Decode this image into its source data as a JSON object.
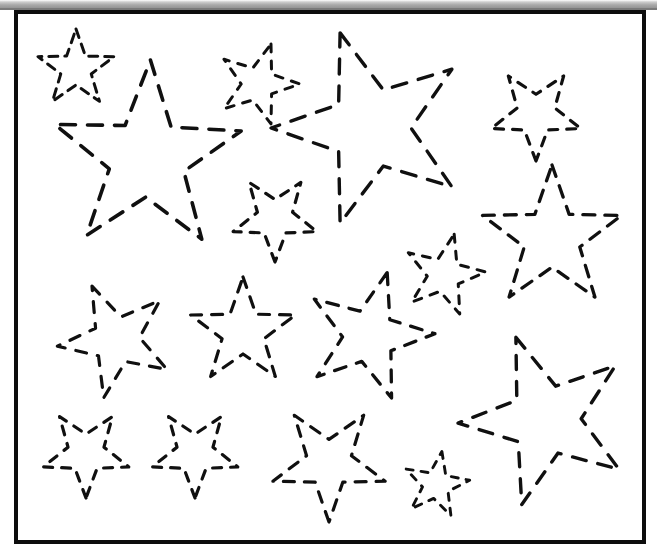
{
  "page": {
    "width": 657,
    "height": 548,
    "background_color": "#ffffff",
    "kind": "tracing-worksheet"
  },
  "scan_artifact": {
    "name": "top-gray-strip",
    "color": "#9a9a9a",
    "height_px": 9
  },
  "frame": {
    "border_color": "#0d0d0d",
    "border_width_px": 4,
    "x": 14,
    "y": 10,
    "width": 632,
    "height": 534
  },
  "stroke": {
    "color": "#101010",
    "dash_style": "dashed",
    "linecap": "round"
  },
  "chart_data": {
    "type": "scatter",
    "title": "",
    "xlabel": "",
    "ylabel": "",
    "count": 18,
    "stars": [
      {
        "id": "star-1",
        "cx": 76,
        "cy": 69,
        "outer_r": 40,
        "inner_ratio": 0.4,
        "rotation_deg": 0,
        "stroke_width": 3.0,
        "dash": "9 7",
        "size": "small"
      },
      {
        "id": "star-2",
        "cx": 147,
        "cy": 158,
        "outer_r": 98,
        "inner_ratio": 0.4,
        "rotation_deg": 2,
        "stroke_width": 3.6,
        "dash": "15 12",
        "size": "large"
      },
      {
        "id": "star-3",
        "cx": 258,
        "cy": 84,
        "outer_r": 42,
        "inner_ratio": 0.4,
        "rotation_deg": 18,
        "stroke_width": 3.0,
        "dash": "8 9",
        "size": "small"
      },
      {
        "id": "star-4",
        "cx": 371,
        "cy": 128,
        "outer_r": 100,
        "inner_ratio": 0.4,
        "rotation_deg": -18,
        "stroke_width": 3.4,
        "dash": "15 12",
        "size": "large"
      },
      {
        "id": "star-5",
        "cx": 536,
        "cy": 114,
        "outer_r": 47,
        "inner_ratio": 0.42,
        "rotation_deg": 180,
        "stroke_width": 3.2,
        "dash": "9 9",
        "size": "small"
      },
      {
        "id": "star-6",
        "cx": 275,
        "cy": 218,
        "outer_r": 44,
        "inner_ratio": 0.42,
        "rotation_deg": 180,
        "stroke_width": 3.2,
        "dash": "9 9",
        "size": "small"
      },
      {
        "id": "star-7",
        "cx": 552,
        "cy": 238,
        "outer_r": 73,
        "inner_ratio": 0.4,
        "rotation_deg": 0,
        "stroke_width": 3.3,
        "dash": "12 10",
        "size": "medium"
      },
      {
        "id": "star-8",
        "cx": 444,
        "cy": 275,
        "outer_r": 42,
        "inner_ratio": 0.4,
        "rotation_deg": 14,
        "stroke_width": 3.0,
        "dash": "8 9",
        "size": "small"
      },
      {
        "id": "star-9",
        "cx": 116,
        "cy": 340,
        "outer_r": 59,
        "inner_ratio": 0.4,
        "rotation_deg": -24,
        "stroke_width": 3.2,
        "dash": "11 11",
        "size": "medium"
      },
      {
        "id": "star-10",
        "cx": 243,
        "cy": 332,
        "outer_r": 55,
        "inner_ratio": 0.4,
        "rotation_deg": 0,
        "stroke_width": 3.2,
        "dash": "11 10",
        "size": "medium"
      },
      {
        "id": "star-11",
        "cx": 369,
        "cy": 336,
        "outer_r": 66,
        "inner_ratio": 0.4,
        "rotation_deg": 16,
        "stroke_width": 3.3,
        "dash": "12 11",
        "size": "medium"
      },
      {
        "id": "star-12",
        "cx": 546,
        "cy": 420,
        "outer_r": 88,
        "inner_ratio": 0.4,
        "rotation_deg": -20,
        "stroke_width": 3.4,
        "dash": "14 12",
        "size": "large"
      },
      {
        "id": "star-13",
        "cx": 86,
        "cy": 453,
        "outer_r": 45,
        "inner_ratio": 0.42,
        "rotation_deg": 180,
        "stroke_width": 3.2,
        "dash": "9 9",
        "size": "small"
      },
      {
        "id": "star-14",
        "cx": 195,
        "cy": 453,
        "outer_r": 45,
        "inner_ratio": 0.42,
        "rotation_deg": 180,
        "stroke_width": 3.2,
        "dash": "9 9",
        "size": "small"
      },
      {
        "id": "star-15",
        "cx": 329,
        "cy": 463,
        "outer_r": 59,
        "inner_ratio": 0.4,
        "rotation_deg": 180,
        "stroke_width": 3.2,
        "dash": "11 10",
        "size": "medium"
      },
      {
        "id": "star-16",
        "cx": 436,
        "cy": 485,
        "outer_r": 34,
        "inner_ratio": 0.4,
        "rotation_deg": 10,
        "stroke_width": 2.9,
        "dash": "7 8",
        "size": "small"
      },
      {
        "id": "star-17",
        "cx": 205,
        "cy": 55,
        "outer_r": 0,
        "inner_ratio": 0.4,
        "rotation_deg": 0,
        "stroke_width": 0,
        "dash": "0 0",
        "size": "none"
      },
      {
        "id": "star-18",
        "cx": 205,
        "cy": 55,
        "outer_r": 0,
        "inner_ratio": 0.4,
        "rotation_deg": 0,
        "stroke_width": 0,
        "dash": "0 0",
        "size": "none"
      }
    ]
  }
}
